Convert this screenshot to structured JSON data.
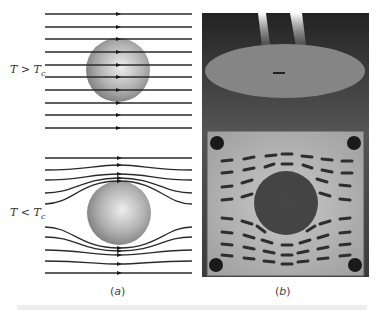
{
  "figure": {
    "panel_a": {
      "caption_open": "(",
      "caption_letter": "a",
      "caption_close": ")",
      "top": {
        "condition_T": "T > T",
        "condition_sub": "c",
        "description": "field lines pass straight through sphere"
      },
      "bottom": {
        "condition_T": "T < T",
        "condition_sub": "c",
        "description": "field lines expelled around sphere"
      }
    },
    "panel_b": {
      "caption_open": "(",
      "caption_letter": "b",
      "caption_close": ")",
      "description": "photograph of levitating magnet and iron filings pattern around superconducting disk"
    }
  },
  "colors": {
    "line": "#2a2a2a",
    "sphere_light": "#e0e0e0",
    "sphere_dark": "#8a8a8a",
    "photo_bg": "#2b2b2b",
    "board": "#b8b8b8",
    "filings": "#3a3a3a",
    "footer_bar": "#ececec"
  }
}
